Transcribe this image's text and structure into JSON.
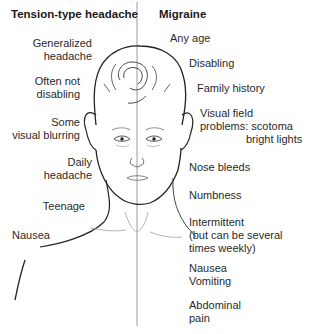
{
  "left_column": {
    "heading": "Tension-type headache",
    "items": [
      {
        "line1": "Generalized",
        "line2": "headache"
      },
      {
        "line1": "Often not",
        "line2": "disabling"
      },
      {
        "line1": "Some",
        "line2": "visual blurring"
      },
      {
        "line1": "Daily",
        "line2": "headache"
      },
      {
        "line1": "Teenage"
      },
      {
        "line1": "Nausea"
      }
    ]
  },
  "right_column": {
    "heading": "Migraine",
    "items": [
      {
        "line1": "Any age"
      },
      {
        "line1": "Disabling"
      },
      {
        "line1": "Family history"
      },
      {
        "line1": "Visual field",
        "line2": "problems: scotoma",
        "line3": "bright lights"
      },
      {
        "line1": "Nose bleeds"
      },
      {
        "line1": "Numbness"
      },
      {
        "line1": "Intermittent",
        "line2": "(but can be several",
        "line3": "times weekly)"
      },
      {
        "line1": "Nausea",
        "line2": "Vomiting"
      },
      {
        "line1": "Abdominal",
        "line2": "pain"
      }
    ]
  },
  "illustration": {
    "subject": "face-line-drawing",
    "divider_color": "#999999",
    "line_color": "#222222"
  }
}
